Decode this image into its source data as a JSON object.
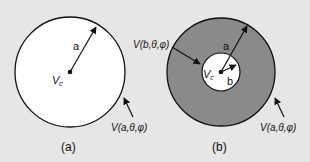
{
  "figure": {
    "background_color": "#e6e6e6",
    "panels": [
      {
        "id": "a",
        "caption": "(a)",
        "description": "Solid sphere of radius a, center potential Vc, surface potential V(a,θ,φ)",
        "labels": {
          "radius": "a",
          "center_potential_main": "V",
          "center_potential_sub": "c",
          "surface_potential": "V(a,θ,φ)"
        },
        "colors": {
          "fill": "#ffffff",
          "stroke": "#111111"
        }
      },
      {
        "id": "b",
        "caption": "(b)",
        "description": "Spherical shell between radius b and radius a, shaded region",
        "labels": {
          "outer_radius": "a",
          "inner_radius": "b",
          "center_potential_main": "V",
          "center_potential_sub": "c",
          "inner_surface_potential": "V(b,θ,φ)",
          "outer_surface_potential": "V(a,θ,φ)"
        },
        "colors": {
          "shell_fill": "#8a8a8a",
          "inner_fill": "#ffffff",
          "stroke": "#111111"
        }
      }
    ]
  }
}
